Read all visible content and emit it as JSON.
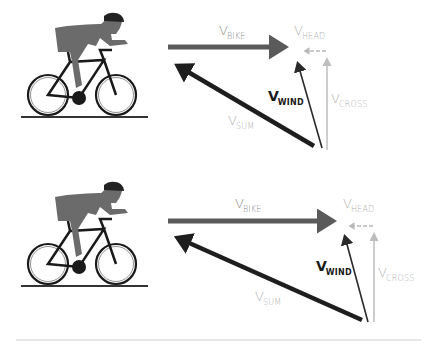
{
  "diagrams": [
    {
      "id": "top",
      "labels": {
        "bike": {
          "main": "V",
          "sub": "BIKE"
        },
        "head": {
          "main": "V",
          "sub": "HEAD"
        },
        "wind": {
          "main": "V",
          "sub": "WIND"
        },
        "cross": {
          "main": "V",
          "sub": "CROSS"
        },
        "sum": {
          "main": "V",
          "sub": "SUM"
        }
      }
    },
    {
      "id": "bottom",
      "labels": {
        "bike": {
          "main": "V",
          "sub": "BIKE"
        },
        "head": {
          "main": "V",
          "sub": "HEAD"
        },
        "wind": {
          "main": "V",
          "sub": "WIND"
        },
        "cross": {
          "main": "V",
          "sub": "CROSS"
        },
        "sum": {
          "main": "V",
          "sub": "SUM"
        }
      }
    }
  ],
  "colors": {
    "bike_arrow": "#5a5a5a",
    "sum_arrow": "#1e1e1e",
    "wind_arrow": "#2a2a2a",
    "head_arrow": "#b8b8b8",
    "cross_arrow": "#bdbdbd",
    "rider": "#6b6b6b",
    "bike": "#1a1a1a"
  }
}
